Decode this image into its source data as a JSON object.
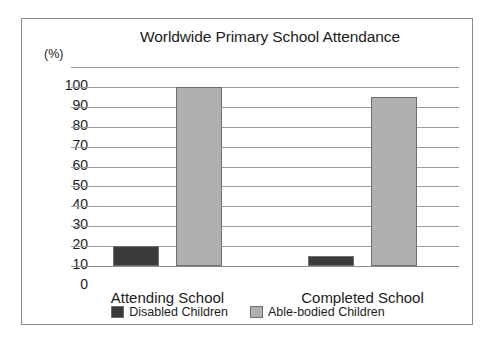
{
  "chart_data": {
    "type": "bar",
    "title": "Worldwide Primary School Attendance",
    "xlabel": "",
    "ylabel": "(%)",
    "ylim": [
      0,
      100
    ],
    "ytick_step": 10,
    "yticks": [
      100,
      90,
      80,
      70,
      60,
      50,
      40,
      30,
      20,
      10,
      0
    ],
    "grid": true,
    "legend_position": "bottom",
    "categories": [
      "Attending School",
      "Completed School"
    ],
    "series": [
      {
        "name": "Disabled Children",
        "color": "#3a3a3a",
        "values": [
          10,
          5
        ]
      },
      {
        "name": "Able-bodied Children",
        "color": "#b0b0b0",
        "values": [
          90,
          85
        ]
      }
    ]
  },
  "frame": {
    "border_color": "#8a8a8a",
    "background": "#ffffff"
  }
}
